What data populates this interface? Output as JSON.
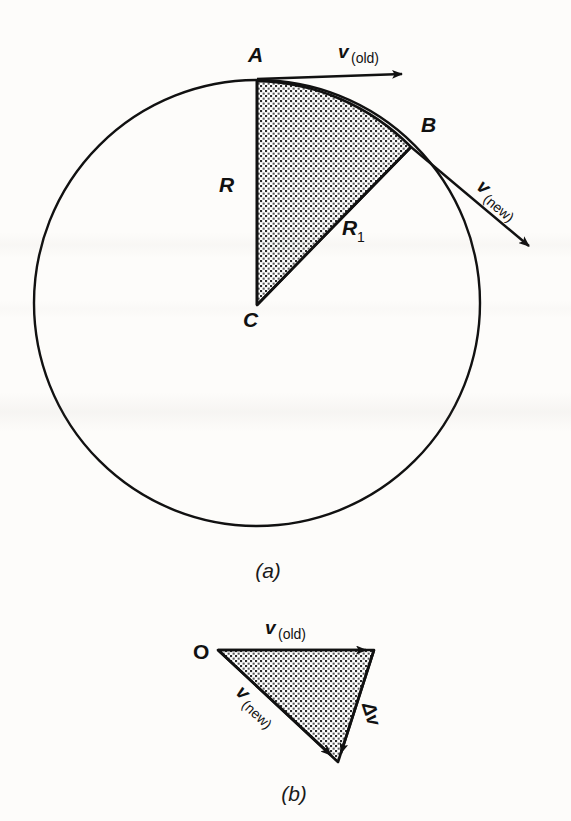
{
  "figure": {
    "background_color": "#fdfcfa",
    "ink_color": "#111111"
  },
  "panel_a": {
    "caption": "(a)",
    "circle": {
      "cx": 257,
      "cy": 303,
      "r": 223
    },
    "points": [
      {
        "name": "A",
        "label": "A",
        "x": 257,
        "y": 80,
        "label_x": 248,
        "label_y": 62
      },
      {
        "name": "B",
        "label": "B",
        "x": 411,
        "y": 147,
        "label_x": 421,
        "label_y": 132
      },
      {
        "name": "C",
        "label": "C",
        "x": 257,
        "y": 305,
        "label_x": 243,
        "label_y": 327
      }
    ],
    "radii": [
      {
        "name": "R",
        "label": "R",
        "from": "C",
        "to": "A",
        "label_x": 219,
        "label_y": 192
      },
      {
        "name": "R1",
        "label": "R",
        "subscript": "1",
        "from": "C",
        "to": "B",
        "label_x": 342,
        "label_y": 235
      }
    ],
    "vectors": [
      {
        "name": "v_old",
        "label": "v",
        "subscript": "(old)",
        "x1": 257,
        "y1": 79,
        "x2": 410,
        "y2": 74,
        "label_x": 350,
        "label_y": 58,
        "rotation": 0
      },
      {
        "name": "v_new",
        "label": "v",
        "subscript": "(new)",
        "x1": 411,
        "y1": 147,
        "x2": 536,
        "y2": 252,
        "label_x": 487,
        "label_y": 198,
        "rotation": 40
      }
    ],
    "sector_fill": "dot-hatch"
  },
  "panel_b": {
    "caption": "(b)",
    "points": [
      {
        "name": "O",
        "label": "O",
        "x": 218,
        "y": 650,
        "label_x": 196,
        "label_y": 658
      },
      {
        "name": "head_old",
        "label": "",
        "x": 374,
        "y": 650
      },
      {
        "name": "head_new",
        "label": "",
        "x": 338,
        "y": 762
      }
    ],
    "vectors": [
      {
        "name": "v_old",
        "label": "v",
        "subscript": "(old)",
        "x1": 218,
        "y1": 650,
        "x2": 374,
        "y2": 650,
        "label_x": 265,
        "label_y": 634,
        "rotation": 0
      },
      {
        "name": "v_new",
        "label": "v",
        "subscript": "(new)",
        "x1": 218,
        "y1": 650,
        "x2": 338,
        "y2": 762,
        "label_x": 238,
        "label_y": 700,
        "rotation": 43
      },
      {
        "name": "delta_v",
        "label": "Δv",
        "subscript": "",
        "x1": 374,
        "y1": 650,
        "x2": 338,
        "y2": 762,
        "label_x": 364,
        "label_y": 718,
        "rotation": 72
      }
    ],
    "triangle_fill": "dot-hatch"
  }
}
